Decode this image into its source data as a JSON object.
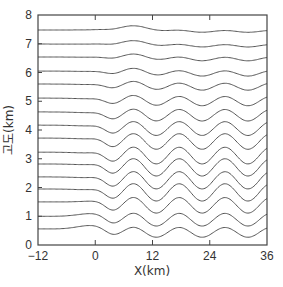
{
  "chart_data": {
    "type": "line",
    "title": "",
    "xlabel": "X(km)",
    "ylabel": "고도(km)",
    "xlim": [
      -12,
      36
    ],
    "ylim": [
      0,
      8
    ],
    "xticks": [
      -12,
      0,
      12,
      24,
      36
    ],
    "yticks": [
      0,
      1,
      2,
      3,
      4,
      5,
      6,
      7,
      8
    ],
    "grid": false,
    "legend": null,
    "wave": {
      "wavelength_km": 9.6,
      "first_crest_x_km": 8,
      "onset_x_km": 0
    },
    "series": [
      {
        "name": "streamline-1",
        "base_height_km": 0.56,
        "amplitude_km": 0.17,
        "upstream_bump_km": 0.15
      },
      {
        "name": "streamline-2",
        "base_height_km": 1.0,
        "amplitude_km": 0.22,
        "upstream_bump_km": 0.12
      },
      {
        "name": "streamline-3",
        "base_height_km": 1.5,
        "amplitude_km": 0.27,
        "upstream_bump_km": 0.05
      },
      {
        "name": "streamline-4",
        "base_height_km": 1.95,
        "amplitude_km": 0.3,
        "upstream_bump_km": 0.0
      },
      {
        "name": "streamline-5",
        "base_height_km": 2.37,
        "amplitude_km": 0.3,
        "upstream_bump_km": 0.0
      },
      {
        "name": "streamline-6",
        "base_height_km": 2.82,
        "amplitude_km": 0.3,
        "upstream_bump_km": 0.0
      },
      {
        "name": "streamline-7",
        "base_height_km": 3.23,
        "amplitude_km": 0.29,
        "upstream_bump_km": 0.0
      },
      {
        "name": "streamline-8",
        "base_height_km": 3.72,
        "amplitude_km": 0.27,
        "upstream_bump_km": 0.0
      },
      {
        "name": "streamline-9",
        "base_height_km": 4.17,
        "amplitude_km": 0.24,
        "upstream_bump_km": 0.0
      },
      {
        "name": "streamline-10",
        "base_height_km": 4.63,
        "amplitude_km": 0.2,
        "upstream_bump_km": 0.0
      },
      {
        "name": "streamline-11",
        "base_height_km": 5.11,
        "amplitude_km": 0.16,
        "upstream_bump_km": 0.0
      },
      {
        "name": "streamline-12",
        "base_height_km": 5.6,
        "amplitude_km": 0.12,
        "upstream_bump_km": 0.0
      },
      {
        "name": "streamline-13",
        "base_height_km": 6.05,
        "amplitude_km": 0.09,
        "upstream_bump_km": 0.0
      },
      {
        "name": "streamline-14",
        "base_height_km": 6.54,
        "amplitude_km": 0.06,
        "upstream_bump_km": 0.0
      },
      {
        "name": "streamline-15",
        "base_height_km": 6.99,
        "amplitude_km": 0.04,
        "upstream_bump_km": 0.0
      },
      {
        "name": "streamline-16",
        "base_height_km": 7.48,
        "amplitude_km": 0.03,
        "upstream_bump_km": 0.0
      }
    ]
  },
  "labels": {
    "xlabel": "X(km)",
    "ylabel": "고도(km)",
    "xticks": [
      "−12",
      "0",
      "12",
      "24",
      "36"
    ],
    "yticks": [
      "0",
      "1",
      "2",
      "3",
      "4",
      "5",
      "6",
      "7",
      "8"
    ]
  }
}
